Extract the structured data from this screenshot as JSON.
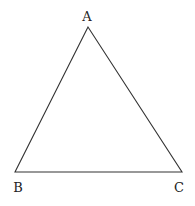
{
  "diagram": {
    "type": "triangle",
    "stroke_color": "#333333",
    "vertices": [
      {
        "label": "A",
        "x": 88,
        "y": 27
      },
      {
        "label": "B",
        "x": 15,
        "y": 172
      },
      {
        "label": "C",
        "x": 182,
        "y": 172
      }
    ],
    "labels": {
      "a": "A",
      "b": "B",
      "c": "C"
    }
  }
}
